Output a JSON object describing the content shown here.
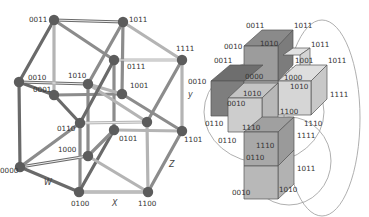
{
  "left_diagram": {
    "title": "Tesseract (4D hypercube) projection",
    "nodes": [
      {
        "id": "0011",
        "label": "0011"
      },
      {
        "id": "1011",
        "label": "1011"
      },
      {
        "id": "1111",
        "label": "1111"
      },
      {
        "id": "0111",
        "label": "0111"
      },
      {
        "id": "0010",
        "label": "0010"
      },
      {
        "id": "1010",
        "label": "1010"
      },
      {
        "id": "0001",
        "label": "0001"
      },
      {
        "id": "1001",
        "label": "1001"
      },
      {
        "id": "0110",
        "label": "0110"
      },
      {
        "id": "0101",
        "label": "0101"
      },
      {
        "id": "1101",
        "label": "1101"
      },
      {
        "id": "1000",
        "label": "1000"
      },
      {
        "id": "0000",
        "label": "0000"
      },
      {
        "id": "0100",
        "label": "0100"
      },
      {
        "id": "1100",
        "label": "1100"
      }
    ],
    "axes": {
      "w": "W",
      "x": "X",
      "y": "y",
      "z": "Z"
    }
  },
  "right_diagram": {
    "title": "Unfolded tesseract (cube cross)",
    "labels": {
      "top_0011": "0011",
      "top_1011": "1011",
      "top_0010": "0010",
      "top_1010": "1010",
      "r_1011a": "1011",
      "r_1001": "1001",
      "r_1011b": "1011",
      "l_0011": "0011",
      "l_0010": "0010",
      "c_0000": "0000",
      "c_1000": "1000",
      "c_1010": "1010",
      "c_1010b": "1010",
      "c_0010": "0010",
      "r_1111": "1111",
      "c_1100": "1100",
      "l_0110": "0110",
      "c_1110": "1110",
      "r_1110": "1110",
      "r_1111b": "1111",
      "l_0110b": "0110",
      "c_1110b": "1110",
      "c_0110": "0110",
      "r_1011c": "1011",
      "b_0010": "0010",
      "b_1010": "1010"
    }
  }
}
